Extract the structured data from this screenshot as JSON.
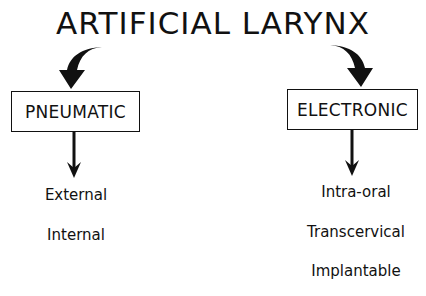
{
  "title": "ARTIFICIAL LARYNX",
  "branches": [
    {
      "label": "PNEUMATIC",
      "items": [
        "External",
        "Internal"
      ]
    },
    {
      "label": "ELECTRONIC",
      "items": [
        "Intra-oral",
        "Transcervical",
        "Implantable"
      ]
    }
  ],
  "icons": {
    "left_curved_arrow": "curved-arrow-down-left",
    "right_curved_arrow": "curved-arrow-down-right",
    "left_down_arrow": "arrow-down",
    "right_down_arrow": "arrow-down"
  },
  "colors": {
    "ink": "#111111",
    "background": "#ffffff"
  }
}
